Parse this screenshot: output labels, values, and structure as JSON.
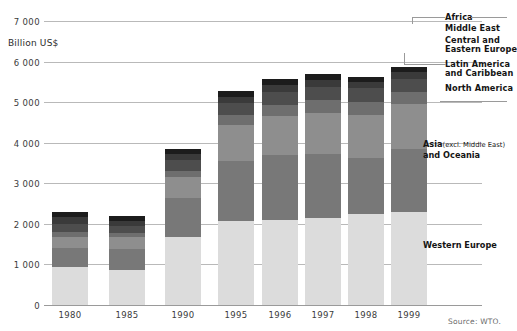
{
  "chart_data": {
    "type": "bar",
    "stacked": true,
    "title": "",
    "subtitle": "",
    "xlabel": "",
    "ylabel": "Billion US$",
    "unit_label": "Billion US$",
    "ylim": [
      0,
      7000
    ],
    "yticks": [
      0,
      1000,
      2000,
      3000,
      4000,
      5000,
      6000,
      7000
    ],
    "ytick_labels": [
      "0",
      "1 000",
      "2 000",
      "3 000",
      "4 000",
      "5 000",
      "6 000",
      "7 000"
    ],
    "grid": true,
    "legend_position": "right",
    "categories": [
      "1980",
      "1985",
      "1990",
      "1995",
      "1996",
      "1997",
      "1998",
      "1999"
    ],
    "series": [
      {
        "name": "Western Europe",
        "color": "#dcdcdc",
        "values": [
          960,
          900,
          1700,
          2100,
          2130,
          2180,
          2270,
          2310
        ]
      },
      {
        "name": "Asia (excl. Middle East) and Oceania",
        "color": "#787878",
        "values": [
          470,
          500,
          970,
          1480,
          1600,
          1570,
          1380,
          1550
        ]
      },
      {
        "name": "North America",
        "color": "#8e8e8e",
        "values": [
          280,
          290,
          520,
          880,
          950,
          1020,
          1060,
          1110
        ]
      },
      {
        "name": "Latin America and Caribbean",
        "color": "#6e6e6e",
        "values": [
          115,
          105,
          150,
          250,
          280,
          310,
          320,
          310
        ]
      },
      {
        "name": "Central and Eastern Europe",
        "color": "#4d4d4d",
        "values": [
          190,
          170,
          270,
          290,
          310,
          320,
          340,
          320
        ]
      },
      {
        "name": "Middle East",
        "color": "#3a3a3a",
        "values": [
          180,
          140,
          140,
          160,
          180,
          180,
          150,
          160
        ]
      },
      {
        "name": "Africa",
        "color": "#1c1c1c",
        "values": [
          130,
          110,
          130,
          130,
          140,
          140,
          130,
          130
        ]
      }
    ],
    "totals": [
      2325,
      2215,
      3880,
      5290,
      5590,
      5720,
      5650,
      5890
    ],
    "colors": {
      "gridline": "#b9b9b9",
      "axis": "#9a9a9a",
      "text": "#141414",
      "tick_text": "#3b3b3b",
      "source_text": "#6a6a6a",
      "background": "#ffffff"
    }
  },
  "legend": {
    "items": [
      {
        "id": "africa",
        "label": "Africa",
        "sub": ""
      },
      {
        "id": "middle-east",
        "label": "Middle East",
        "sub": ""
      },
      {
        "id": "central-eastern-europe",
        "label": "Central and",
        "label2": "Eastern Europe",
        "sub": ""
      },
      {
        "id": "latin-america",
        "label": "Latin America",
        "label2": "and Caribbean",
        "sub": ""
      },
      {
        "id": "north-america",
        "label": "North America",
        "sub": ""
      }
    ]
  },
  "inplot_labels": {
    "asia": "Asia",
    "asia_sub": "(excl. Middle East)",
    "asia_line2": "and Oceania",
    "western_europe": "Western Europe"
  },
  "footer": {
    "source": "Source: WTO."
  }
}
